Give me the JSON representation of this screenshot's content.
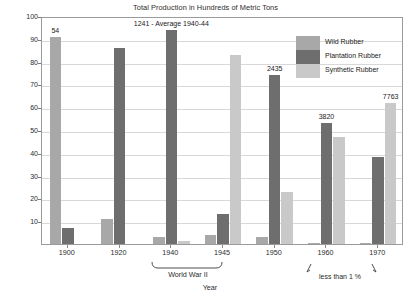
{
  "chart_data": {
    "type": "bar",
    "title": "Total Production in Hundreds of Metric Tons",
    "xlabel": "Year",
    "ylabel": "Percent of Production",
    "ylim": [
      0,
      100
    ],
    "ytick_labels": [
      "100",
      "90",
      "80",
      "70",
      "60",
      "50",
      "40",
      "30",
      "20",
      "10"
    ],
    "ytick_values": [
      100,
      90,
      80,
      70,
      60,
      50,
      40,
      30,
      20,
      10
    ],
    "grid": true,
    "legend_position": "top-right",
    "categories": [
      "1900",
      "1920",
      "1940",
      "1945",
      "1950",
      "1960",
      "1970"
    ],
    "series": [
      {
        "name": "Wild Rubber",
        "color": "#a8a8a8",
        "values": [
          91,
          11,
          3,
          4,
          3,
          0.5,
          0.5
        ]
      },
      {
        "name": "Plantation Rubber",
        "color": "#6e6e6e",
        "values": [
          7,
          86,
          94,
          13,
          74,
          53,
          38
        ]
      },
      {
        "name": "Synthetic Rubber",
        "color": "#c9c9c9",
        "values": [
          0,
          0,
          1.5,
          83,
          23,
          47,
          62
        ]
      }
    ],
    "data_labels": [
      {
        "text": "54",
        "category": "1900",
        "series": "Wild Rubber"
      },
      {
        "text": "1241 - Average 1940-44",
        "category": "1940",
        "series": "Plantation Rubber"
      },
      {
        "text": "2435",
        "category": "1950",
        "series": "Plantation Rubber"
      },
      {
        "text": "3820",
        "category": "1960",
        "series": "Plantation Rubber"
      },
      {
        "text": "7763",
        "category": "1970",
        "series": "Synthetic Rubber"
      }
    ],
    "annotations": [
      {
        "text": "World War II",
        "type": "bracket",
        "spans": [
          "1940",
          "1945"
        ]
      },
      {
        "text": "less than 1 %",
        "type": "arrow-callout",
        "points_to": [
          "1960",
          "1970"
        ]
      }
    ]
  },
  "labels": {
    "title": "Total Production in Hundreds of Metric Tons",
    "y_axis": "Percent of Production",
    "x_axis": "Year",
    "ww2": "World War II",
    "less_than_one": "less than 1 %"
  },
  "legend": {
    "items": [
      {
        "label": "Wild Rubber",
        "color": "#a8a8a8"
      },
      {
        "label": "Plantation Rubber",
        "color": "#6e6e6e"
      },
      {
        "label": "Synthetic Rubber",
        "color": "#c9c9c9"
      }
    ]
  }
}
